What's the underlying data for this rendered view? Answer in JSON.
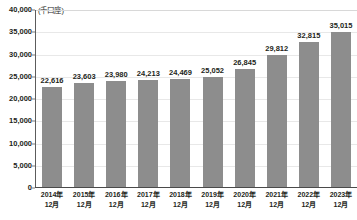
{
  "chart_data": {
    "type": "bar",
    "title": "",
    "subtitle": "",
    "unit_label": "(千口座)",
    "xlabel": "",
    "ylabel": "",
    "ylim": [
      0,
      40000
    ],
    "ytick_step": 5000,
    "grid": true,
    "legend": "none",
    "bar_color": "#8d8d8d",
    "categories": [
      "2014年12月",
      "2015年12月",
      "2016年12月",
      "2017年12月",
      "2018年12月",
      "2019年12月",
      "2020年12月",
      "2021年12月",
      "2022年12月",
      "2023年12月"
    ],
    "category_lines": [
      {
        "year": "2014年",
        "month": "12月"
      },
      {
        "year": "2015年",
        "month": "12月"
      },
      {
        "year": "2016年",
        "month": "12月"
      },
      {
        "year": "2017年",
        "month": "12月"
      },
      {
        "year": "2018年",
        "month": "12月"
      },
      {
        "year": "2019年",
        "month": "12月"
      },
      {
        "year": "2020年",
        "month": "12月"
      },
      {
        "year": "2021年",
        "month": "12月"
      },
      {
        "year": "2022年",
        "month": "12月"
      },
      {
        "year": "2023年",
        "month": "12月"
      }
    ],
    "values": [
      22616,
      23603,
      23980,
      24213,
      24469,
      25052,
      26845,
      29812,
      32815,
      35015
    ],
    "value_labels": [
      "22,616",
      "23,603",
      "23,980",
      "24,213",
      "24,469",
      "25,052",
      "26,845",
      "29,812",
      "32,815",
      "35,015"
    ],
    "ytick_labels": [
      "40,000",
      "35,000",
      "30,000",
      "25,000",
      "20,000",
      "15,000",
      "10,000",
      "5,000",
      "0"
    ],
    "ytick_values": [
      40000,
      35000,
      30000,
      25000,
      20000,
      15000,
      10000,
      5000,
      0
    ]
  }
}
